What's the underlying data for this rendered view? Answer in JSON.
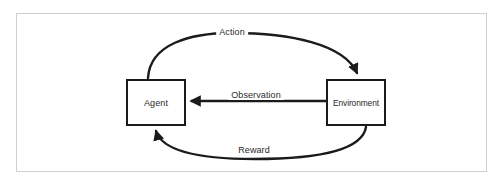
{
  "figure": {
    "type": "reinforcement-learning-loop-diagram",
    "background_color": "#ffffff",
    "frame_color": "#cfcfcf",
    "stroke_color": "#1b1b1b",
    "text_color": "#2b2b2b"
  },
  "nodes": [
    {
      "id": "agent",
      "label": "Agent"
    },
    {
      "id": "environment",
      "label": "Environment"
    }
  ],
  "edges": [
    {
      "id": "action",
      "label": "Action",
      "from": "agent",
      "to": "environment",
      "shape": "curved-arc-above",
      "arrowhead": "to"
    },
    {
      "id": "observation",
      "label": "Observation",
      "from": "environment",
      "to": "agent",
      "shape": "straight-horizontal",
      "arrowhead": "to"
    },
    {
      "id": "reward",
      "label": "Reward",
      "from": "environment",
      "to": "agent",
      "shape": "curved-arc-below",
      "arrowhead": "to"
    }
  ]
}
